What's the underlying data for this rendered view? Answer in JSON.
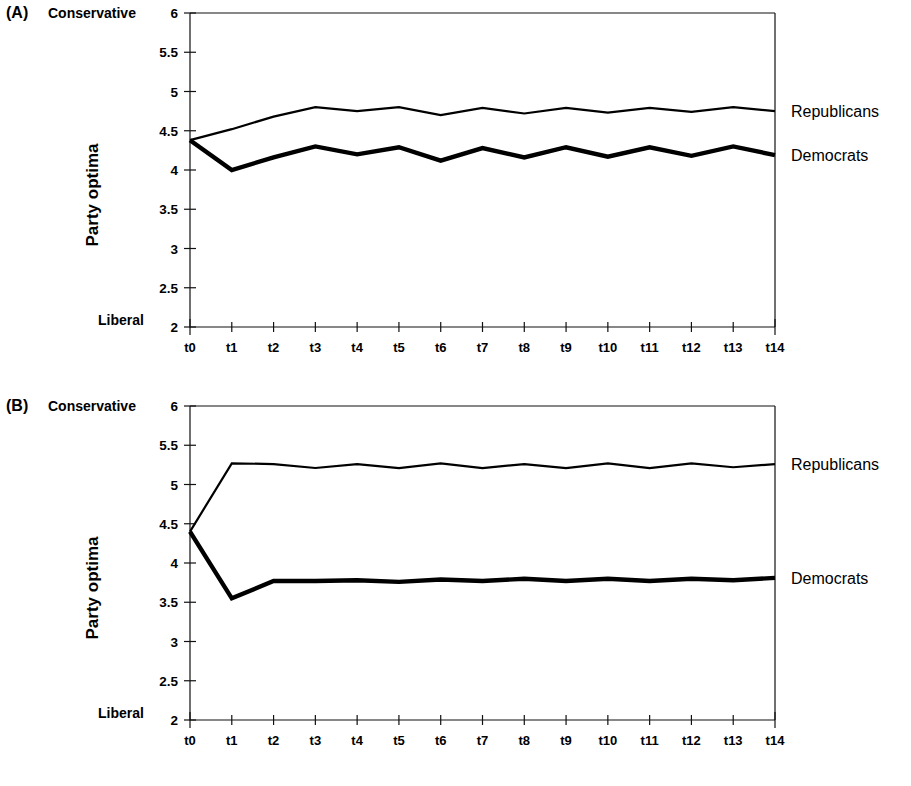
{
  "figure": {
    "panels": [
      {
        "id": "A",
        "letter": "(A)",
        "top_label": "Conservative",
        "bottom_label": "Liberal",
        "y_axis_title": "Party optima",
        "series_labels": [
          "Republicans",
          "Democrats"
        ]
      },
      {
        "id": "B",
        "letter": "(B)",
        "top_label": "Conservative",
        "bottom_label": "Liberal",
        "y_axis_title": "Party optima",
        "series_labels": [
          "Republicans",
          "Democrats"
        ]
      }
    ]
  },
  "chart_data": [
    {
      "type": "line",
      "panel": "A",
      "title": "",
      "xlabel": "",
      "ylabel": "Party optima",
      "ylim": [
        2,
        6
      ],
      "yticks": [
        2,
        2.5,
        3,
        3.5,
        4,
        4.5,
        5,
        5.5,
        6
      ],
      "ytick_labels": [
        "2",
        "2.5",
        "3",
        "3.5",
        "4",
        "4.5",
        "5",
        "5.5",
        "6"
      ],
      "y_axis_top_annotation": "Conservative",
      "y_axis_bottom_annotation": "Liberal",
      "x": [
        "t0",
        "t1",
        "t2",
        "t3",
        "t4",
        "t5",
        "t6",
        "t7",
        "t8",
        "t9",
        "t10",
        "t11",
        "t12",
        "t13",
        "t14"
      ],
      "grid": false,
      "legend_position": "right-inline",
      "series": [
        {
          "name": "Republicans",
          "values": [
            4.38,
            4.52,
            4.68,
            4.8,
            4.75,
            4.8,
            4.7,
            4.79,
            4.72,
            4.79,
            4.73,
            4.79,
            4.74,
            4.8,
            4.75
          ]
        },
        {
          "name": "Democrats",
          "values": [
            4.38,
            4.0,
            4.16,
            4.3,
            4.2,
            4.29,
            4.12,
            4.28,
            4.16,
            4.29,
            4.17,
            4.29,
            4.18,
            4.3,
            4.19
          ]
        }
      ]
    },
    {
      "type": "line",
      "panel": "B",
      "title": "",
      "xlabel": "",
      "ylabel": "Party optima",
      "ylim": [
        2,
        6
      ],
      "yticks": [
        2,
        2.5,
        3,
        3.5,
        4,
        4.5,
        5,
        5.5,
        6
      ],
      "ytick_labels": [
        "2",
        "2.5",
        "3",
        "3.5",
        "4",
        "4.5",
        "5",
        "5.5",
        "6"
      ],
      "y_axis_top_annotation": "Conservative",
      "y_axis_bottom_annotation": "Liberal",
      "x": [
        "t0",
        "t1",
        "t2",
        "t3",
        "t4",
        "t5",
        "t6",
        "t7",
        "t8",
        "t9",
        "t10",
        "t11",
        "t12",
        "t13",
        "t14"
      ],
      "grid": false,
      "legend_position": "right-inline",
      "series": [
        {
          "name": "Republicans",
          "values": [
            4.4,
            5.27,
            5.26,
            5.21,
            5.26,
            5.21,
            5.27,
            5.21,
            5.26,
            5.21,
            5.27,
            5.21,
            5.27,
            5.22,
            5.26
          ]
        },
        {
          "name": "Democrats",
          "values": [
            4.4,
            3.55,
            3.77,
            3.77,
            3.78,
            3.76,
            3.79,
            3.77,
            3.8,
            3.77,
            3.8,
            3.77,
            3.8,
            3.78,
            3.81
          ]
        }
      ]
    }
  ]
}
